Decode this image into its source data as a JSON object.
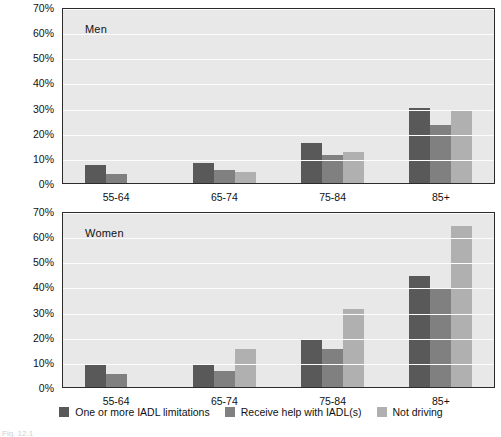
{
  "chart_data": {
    "type": "bar",
    "title": "",
    "panels": [
      {
        "tag": "Men",
        "categories": [
          "55-64",
          "65-74",
          "75-84",
          "85+"
        ],
        "series": [
          {
            "name": "One or more IADL limitations",
            "color": "#595959",
            "values": [
              7,
              8,
              16,
              30
            ]
          },
          {
            "name": "Receive help with IADL(s)",
            "color": "#808080",
            "values": [
              3.5,
              5,
              11,
              23
            ]
          },
          {
            "name": "Not driving",
            "color": "#b0b0b0",
            "values": [
              0,
              4.5,
              12.5,
              29
            ]
          }
        ],
        "ylim": [
          0,
          70
        ],
        "yticks": [
          0,
          10,
          20,
          30,
          40,
          50,
          60,
          70
        ],
        "yticklabels": [
          "0%",
          "10%",
          "20%",
          "30%",
          "40%",
          "50%",
          "60%",
          "70%"
        ]
      },
      {
        "tag": "Women",
        "categories": [
          "55-64",
          "65-74",
          "75-84",
          "85+"
        ],
        "series": [
          {
            "name": "One or more IADL limitations",
            "color": "#595959",
            "values": [
              9,
              9,
              19,
              44
            ]
          },
          {
            "name": "Receive help with IADL(s)",
            "color": "#808080",
            "values": [
              5,
              6.5,
              15,
              39
            ]
          },
          {
            "name": "Not driving",
            "color": "#b0b0b0",
            "values": [
              0,
              15,
              31,
              64
            ]
          }
        ],
        "ylim": [
          0,
          70
        ],
        "yticks": [
          0,
          10,
          20,
          30,
          40,
          50,
          60,
          70
        ],
        "yticklabels": [
          "0%",
          "10%",
          "20%",
          "30%",
          "40%",
          "50%",
          "60%",
          "70%"
        ]
      }
    ],
    "xlabel": "",
    "ylabel": "",
    "grid": true,
    "legend_position": "bottom",
    "legend": [
      {
        "label": "One or more IADL limitations",
        "color": "#595959"
      },
      {
        "label": "Receive help with IADL(s)",
        "color": "#808080"
      },
      {
        "label": "Not driving",
        "color": "#b0b0b0"
      }
    ]
  },
  "caption": "Fig. 12.1"
}
